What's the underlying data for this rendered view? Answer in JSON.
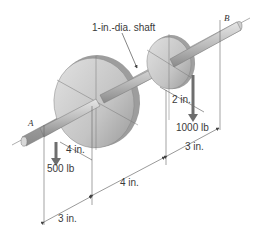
{
  "diagram": {
    "labels": {
      "shaft": "1-in.-dia. shaft",
      "point_a": "A",
      "point_b": "B",
      "small_pulley_radius": "2 in.",
      "large_pulley_radius": "4 in.",
      "load_right": "1000 lb",
      "load_left": "500 lb",
      "dim_a_to_large": "3 in.",
      "dim_large_to_small": "4 in.",
      "dim_small_to_b": "3 in."
    },
    "colors": {
      "shaft": "#b5b5b5",
      "pulley": "#c8c8c8",
      "arrow": "#6e6e6e",
      "dim_line": "#555555"
    }
  }
}
